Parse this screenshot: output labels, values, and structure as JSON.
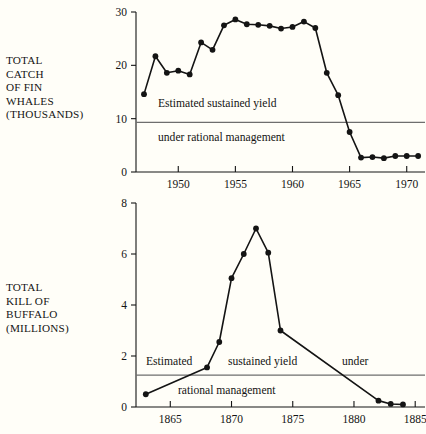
{
  "figure": {
    "background_color": "#fffef8",
    "ink_color": "#141414",
    "rule_color": "#6e6e6e"
  },
  "panels": [
    {
      "id": "fin-whales",
      "axis_label": "TOTAL\nCATCH\nOF FIN\nWHALES\n(THOUSANDS)",
      "annotation_line1": "Estimated sustained yield",
      "annotation_line2": "under rational management"
    },
    {
      "id": "buffalo",
      "axis_label": "TOTAL\nKILL OF\nBUFFALO\n(MILLIONS)",
      "annotation_line1": "Estimated",
      "annotation_line2": "sustained yield",
      "annotation_line3": "under",
      "annotation_line4": "rational management"
    }
  ],
  "chart_data": [
    {
      "type": "line",
      "id": "fin-whales",
      "title": "",
      "xlabel": "",
      "ylabel": "TOTAL CATCH OF FIN WHALES (THOUSANDS)",
      "xlim": [
        1946.3,
        1971.6
      ],
      "ylim": [
        0,
        30
      ],
      "xticks": [
        1950,
        1955,
        1960,
        1965,
        1970
      ],
      "xtick_labels": [
        "1950",
        "1955",
        "1960",
        "1965",
        "1970"
      ],
      "yticks": [
        0,
        10,
        20,
        30
      ],
      "ytick_labels": [
        "0",
        "10",
        "20",
        "30"
      ],
      "grid": false,
      "legend": "none",
      "reference_line": {
        "label": "Estimated sustained yield under rational management",
        "value": 9.3,
        "orientation": "horizontal"
      },
      "x": [
        1947,
        1948,
        1949,
        1950,
        1951,
        1952,
        1953,
        1954,
        1955,
        1956,
        1957,
        1958,
        1959,
        1960,
        1961,
        1962,
        1963,
        1964,
        1965,
        1966,
        1967,
        1968,
        1969,
        1970,
        1971
      ],
      "values": [
        14.6,
        21.7,
        18.6,
        19.0,
        18.3,
        24.3,
        22.9,
        27.5,
        28.6,
        27.7,
        27.6,
        27.4,
        26.9,
        27.2,
        28.2,
        27.0,
        18.6,
        14.4,
        7.5,
        2.7,
        2.8,
        2.6,
        3.0,
        3.0,
        3.0
      ]
    },
    {
      "type": "line",
      "id": "buffalo",
      "title": "",
      "xlabel": "",
      "ylabel": "TOTAL KILL OF BUFFALO (MILLIONS)",
      "xlim": [
        1862.2,
        1885.8
      ],
      "ylim": [
        0,
        8
      ],
      "xticks": [
        1865,
        1870,
        1875,
        1880,
        1885
      ],
      "xtick_labels": [
        "1865",
        "1870",
        "1875",
        "1880",
        "1885"
      ],
      "yticks": [
        0,
        2,
        4,
        6,
        8
      ],
      "ytick_labels": [
        "0",
        "2",
        "4",
        "6",
        "8"
      ],
      "grid": false,
      "legend": "none",
      "reference_line": {
        "label": "Estimated sustained yield under rational management",
        "value": 1.25,
        "orientation": "horizontal"
      },
      "x": [
        1863,
        1868,
        1869,
        1870,
        1871,
        1872,
        1873,
        1874,
        1882,
        1883,
        1884
      ],
      "values": [
        0.5,
        1.55,
        2.55,
        5.05,
        6.0,
        7.0,
        6.05,
        3.0,
        0.25,
        0.12,
        0.1
      ]
    }
  ]
}
